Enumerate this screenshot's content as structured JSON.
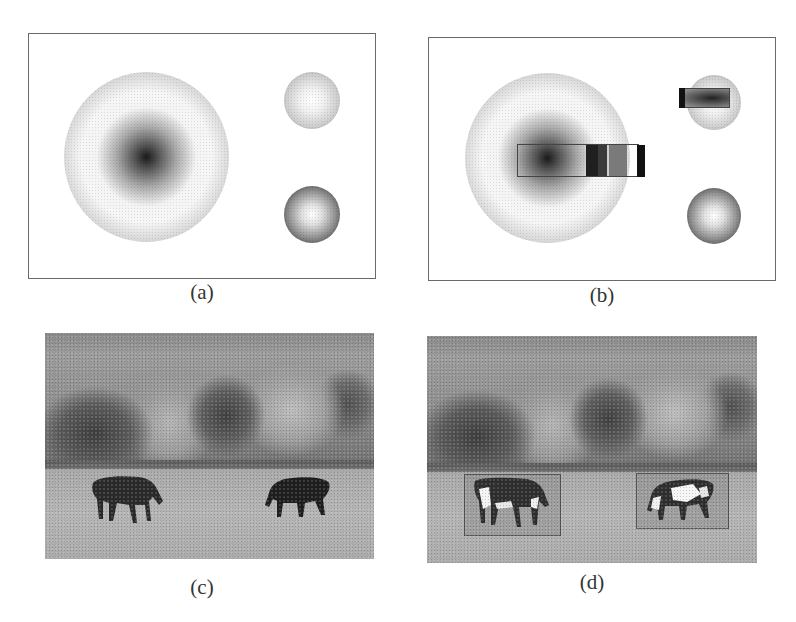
{
  "figure": {
    "panels": [
      {
        "id": "a",
        "caption": "(a)",
        "type": "synthetic-image",
        "content": "three radially shaded spheres: one large with dark center, two small on right (top light, bottom dark-rimmed)"
      },
      {
        "id": "b",
        "caption": "(b)",
        "type": "synthetic-image",
        "content": "same spheres with rectangular perturbation regions overlaid on large sphere and small top sphere"
      },
      {
        "id": "c",
        "caption": "(c)",
        "type": "photograph",
        "content": "grayscale photo of two horses grazing in a field with trees behind"
      },
      {
        "id": "d",
        "caption": "(d)",
        "type": "photograph",
        "content": "same photo with two rectangular regions around horses showing altered/perturbed texture"
      }
    ],
    "colors": {
      "background": "#ffffff",
      "frame": "#6a6a6a",
      "caption_text": "#333333"
    }
  }
}
